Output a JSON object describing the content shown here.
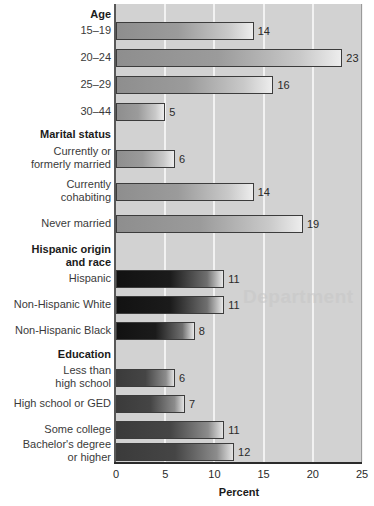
{
  "chart_data": {
    "type": "bar",
    "orientation": "horizontal",
    "title": "",
    "xlabel": "Percent",
    "ylabel": "",
    "xlim": [
      0,
      25
    ],
    "xticks": [
      0,
      5,
      10,
      15,
      20,
      25
    ],
    "xtick_labels": [
      "0",
      "5",
      "10",
      "15",
      "20",
      "25"
    ],
    "grid": true,
    "grid_axis": "x",
    "legend": false,
    "groups": [
      {
        "header": "Age",
        "tone": "light",
        "categories": [
          "15–19",
          "20–24",
          "25–29",
          "30–44"
        ],
        "values": [
          14,
          23,
          16,
          5
        ]
      },
      {
        "header": "Marital status",
        "tone": "light",
        "categories": [
          "Currently or\nformerly married",
          "Currently\ncohabiting",
          "Never married"
        ],
        "values": [
          6,
          14,
          19
        ]
      },
      {
        "header": "Hispanic origin\nand race",
        "tone": "dark",
        "categories": [
          "Hispanic",
          "Non-Hispanic White",
          "Non-Hispanic Black"
        ],
        "values": [
          11,
          11,
          8
        ]
      },
      {
        "header": "Education",
        "tone": "mid",
        "categories": [
          "Less than\nhigh school",
          "High school or GED",
          "Some college",
          "Bachelor's degree\nor higher"
        ],
        "values": [
          6,
          7,
          11,
          12
        ]
      }
    ],
    "all_categories": [
      "15–19",
      "20–24",
      "25–29",
      "30–44",
      "Currently or formerly married",
      "Currently cohabiting",
      "Never married",
      "Hispanic",
      "Non-Hispanic White",
      "Non-Hispanic Black",
      "Less than high school",
      "High school or GED",
      "Some college",
      "Bachelor's degree or higher"
    ],
    "all_values": [
      14,
      23,
      16,
      5,
      6,
      14,
      19,
      11,
      11,
      8,
      6,
      7,
      11,
      12
    ]
  },
  "rows": [
    {
      "kind": "header",
      "text": "Age",
      "y": 8,
      "label_y": 8
    },
    {
      "kind": "bar",
      "text": "15–19",
      "value": 14,
      "y": 22,
      "label_y": 24,
      "tone": "tone-light"
    },
    {
      "kind": "bar",
      "text": "20–24",
      "value": 23,
      "y": 49,
      "label_y": 51,
      "tone": "tone-light"
    },
    {
      "kind": "bar",
      "text": "25–29",
      "value": 16,
      "y": 76,
      "label_y": 78,
      "tone": "tone-light"
    },
    {
      "kind": "bar",
      "text": "30–44",
      "value": 5,
      "y": 103,
      "label_y": 105,
      "tone": "tone-light"
    },
    {
      "kind": "header",
      "text": "Marital status",
      "y": 128,
      "label_y": 128
    },
    {
      "kind": "bar",
      "text": "Currently or\nformerly married",
      "value": 6,
      "y": 150,
      "label_y": 145,
      "tone": "tone-light"
    },
    {
      "kind": "bar",
      "text": "Currently\ncohabiting",
      "value": 14,
      "y": 183,
      "label_y": 178,
      "tone": "tone-light"
    },
    {
      "kind": "bar",
      "text": "Never married",
      "value": 19,
      "y": 215,
      "label_y": 217,
      "tone": "tone-light"
    },
    {
      "kind": "header",
      "text": "Hispanic origin\nand race",
      "y": 243,
      "label_y": 243
    },
    {
      "kind": "bar",
      "text": "Hispanic",
      "value": 11,
      "y": 270,
      "label_y": 272,
      "tone": "tone-dark"
    },
    {
      "kind": "bar",
      "text": "Non-Hispanic White",
      "value": 11,
      "y": 296,
      "label_y": 298,
      "tone": "tone-dark"
    },
    {
      "kind": "bar",
      "text": "Non-Hispanic Black",
      "value": 8,
      "y": 322,
      "label_y": 324,
      "tone": "tone-dark"
    },
    {
      "kind": "header",
      "text": "Education",
      "y": 348,
      "label_y": 348
    },
    {
      "kind": "bar",
      "text": "Less than\nhigh school",
      "value": 6,
      "y": 369,
      "label_y": 364,
      "tone": "tone-mid"
    },
    {
      "kind": "bar",
      "text": "High school or GED",
      "value": 7,
      "y": 395,
      "label_y": 397,
      "tone": "tone-mid"
    },
    {
      "kind": "bar",
      "text": "Some college",
      "value": 11,
      "y": 421,
      "label_y": 423,
      "tone": "tone-mid"
    },
    {
      "kind": "bar",
      "text": "Bachelor's degree\nor higher",
      "value": 12,
      "y": 443,
      "label_y": 438,
      "tone": "tone-mid"
    }
  ],
  "axis": {
    "ticks": [
      "0",
      "5",
      "10",
      "15",
      "20",
      "25"
    ],
    "title": "Percent"
  },
  "watermark": {
    "text": "Department"
  }
}
